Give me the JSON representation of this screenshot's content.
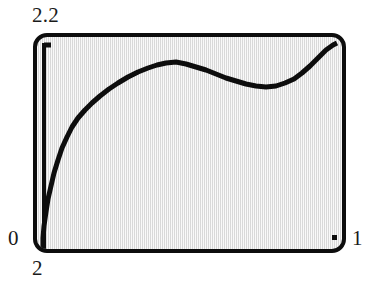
{
  "figure": {
    "kind": "graphing-calculator-screen",
    "device_screen": {
      "background_color": "#e6e6e6",
      "border_color": "#0d0d0d",
      "ink_color": "#0d0d0d"
    },
    "labels": {
      "y_max": "2.2",
      "y_min": "0",
      "x_min": "2",
      "x_max": "1"
    },
    "cursor_dot": {
      "name": "trace-cursor-dot"
    }
  },
  "chart_data": {
    "type": "line",
    "title": "",
    "xlabel": "",
    "ylabel": "",
    "xlim": [
      2,
      1
    ],
    "ylim": [
      0,
      2.2
    ],
    "grid": false,
    "legend": null,
    "axis_tick_labels": {
      "x": [
        "2",
        "1"
      ],
      "y": [
        "0",
        "2.2"
      ]
    },
    "annotations": [
      {
        "label": "local-maximum",
        "x_px": 165,
        "y_px": 62
      },
      {
        "label": "local-minimum",
        "x_px": 266,
        "y_px": 86
      },
      {
        "label": "curve-start",
        "x_px": 43,
        "y_px": 249
      },
      {
        "label": "curve-end",
        "x_px": 337,
        "y_px": 43
      }
    ],
    "series": [
      {
        "name": "plotted-function",
        "color": "#0d0d0d",
        "points_px": [
          [
            43,
            250
          ],
          [
            43,
            238
          ],
          [
            44,
            226
          ],
          [
            46,
            212
          ],
          [
            48,
            199
          ],
          [
            51,
            186
          ],
          [
            54,
            173
          ],
          [
            58,
            160
          ],
          [
            62,
            148
          ],
          [
            67,
            137
          ],
          [
            72,
            127
          ],
          [
            78,
            118
          ],
          [
            85,
            110
          ],
          [
            92,
            103
          ],
          [
            100,
            96
          ],
          [
            109,
            89
          ],
          [
            118,
            83
          ],
          [
            128,
            77
          ],
          [
            138,
            72
          ],
          [
            148,
            68
          ],
          [
            157,
            65
          ],
          [
            166,
            63
          ],
          [
            176,
            62
          ],
          [
            186,
            64
          ],
          [
            196,
            67
          ],
          [
            206,
            70
          ],
          [
            216,
            74
          ],
          [
            226,
            78
          ],
          [
            236,
            81
          ],
          [
            246,
            84
          ],
          [
            256,
            86
          ],
          [
            266,
            87
          ],
          [
            276,
            86
          ],
          [
            285,
            83
          ],
          [
            294,
            79
          ],
          [
            302,
            73
          ],
          [
            310,
            66
          ],
          [
            318,
            58
          ],
          [
            326,
            50
          ],
          [
            333,
            45
          ],
          [
            337,
            43
          ]
        ]
      }
    ]
  }
}
